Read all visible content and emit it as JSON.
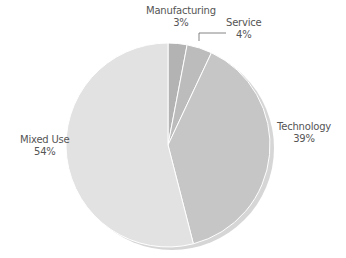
{
  "chart_data": {
    "type": "pie",
    "title": "",
    "categories": [
      "Manufacturing",
      "Service",
      "Technology",
      "Mixed Use"
    ],
    "values": [
      3,
      4,
      39,
      54
    ],
    "value_labels": [
      "3%",
      "4%",
      "39%",
      "54%"
    ],
    "colors": [
      "#b3b3b3",
      "#bcbcbc",
      "#c6c6c6",
      "#e2e2e2"
    ],
    "start_angle_deg": 0,
    "direction": "clockwise",
    "legend": "none",
    "data_labels": "outside"
  },
  "labels": {
    "manufacturing": {
      "name": "Manufacturing",
      "pct": "3%"
    },
    "service": {
      "name": "Service",
      "pct": "4%"
    },
    "technology": {
      "name": "Technology",
      "pct": "39%"
    },
    "mixed_use": {
      "name": "Mixed Use",
      "pct": "54%"
    }
  }
}
